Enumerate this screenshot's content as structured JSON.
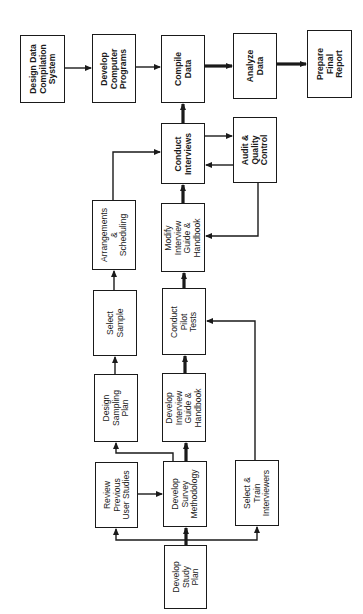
{
  "diagram": {
    "type": "flowchart",
    "orientation": "rotated-90-ccw",
    "nodes": [
      {
        "id": "design_data_compilation",
        "label": "Design Data\nCompilation\nSystem",
        "bold": true
      },
      {
        "id": "develop_computer_programs",
        "label": "Develop\nComputer\nPrograms",
        "bold": true
      },
      {
        "id": "compile_data",
        "label": "Compile\nData",
        "bold": true
      },
      {
        "id": "analyze_data",
        "label": "Analyze\nData",
        "bold": true
      },
      {
        "id": "prepare_final_report",
        "label": "Prepare\nFinal\nReport",
        "bold": true
      },
      {
        "id": "conduct_interviews",
        "label": "Conduct\nInterviews",
        "bold": true
      },
      {
        "id": "audit_quality_control",
        "label": "Audit &\nQuality\nControl",
        "bold": true
      },
      {
        "id": "arrangements_scheduling",
        "label": "Arrangements\n&\nScheduling",
        "bold": false
      },
      {
        "id": "modify_interview_guide",
        "label": "Modify\nInterview\nGuide &\nHandbook",
        "bold": false
      },
      {
        "id": "select_sample",
        "label": "Select\nSample",
        "bold": false
      },
      {
        "id": "conduct_pilot_tests",
        "label": "Conduct\nPilot\nTests",
        "bold": false
      },
      {
        "id": "design_sampling_plan",
        "label": "Design\nSampling\nPlan",
        "bold": false
      },
      {
        "id": "develop_interview_guide",
        "label": "Develop\nInterview\nGuide &\nHandbook",
        "bold": false
      },
      {
        "id": "review_previous_studies",
        "label": "Review\nPrevious\nUser Studies",
        "bold": false
      },
      {
        "id": "develop_survey_methodology",
        "label": "Develop\nSurvey\nMethodology",
        "bold": false
      },
      {
        "id": "select_train_interviewers",
        "label": "Select &\nTrain\nInterviewers",
        "bold": false
      },
      {
        "id": "develop_study_plan",
        "label": "Develop\nStudy\nPlan",
        "bold": false
      }
    ],
    "edges": [
      {
        "from": "design_data_compilation",
        "to": "develop_computer_programs",
        "weight": "normal"
      },
      {
        "from": "develop_computer_programs",
        "to": "compile_data",
        "weight": "normal"
      },
      {
        "from": "compile_data",
        "to": "analyze_data",
        "weight": "heavy"
      },
      {
        "from": "analyze_data",
        "to": "prepare_final_report",
        "weight": "heavy"
      },
      {
        "from": "conduct_interviews",
        "to": "compile_data",
        "weight": "heavy"
      },
      {
        "from": "conduct_interviews",
        "to": "audit_quality_control",
        "weight": "normal"
      },
      {
        "from": "audit_quality_control",
        "to": "conduct_interviews",
        "weight": "normal"
      },
      {
        "from": "audit_quality_control",
        "to": "modify_interview_guide",
        "weight": "normal"
      },
      {
        "from": "arrangements_scheduling",
        "to": "conduct_interviews",
        "weight": "normal"
      },
      {
        "from": "modify_interview_guide",
        "to": "conduct_interviews",
        "weight": "heavy"
      },
      {
        "from": "select_sample",
        "to": "arrangements_scheduling",
        "weight": "normal"
      },
      {
        "from": "conduct_pilot_tests",
        "to": "modify_interview_guide",
        "weight": "heavy"
      },
      {
        "from": "design_sampling_plan",
        "to": "select_sample",
        "weight": "normal"
      },
      {
        "from": "develop_interview_guide",
        "to": "conduct_pilot_tests",
        "weight": "heavy"
      },
      {
        "from": "select_train_interviewers",
        "to": "conduct_pilot_tests",
        "weight": "normal"
      },
      {
        "from": "develop_survey_methodology",
        "to": "design_sampling_plan",
        "weight": "normal"
      },
      {
        "from": "develop_survey_methodology",
        "to": "develop_interview_guide",
        "weight": "heavy"
      },
      {
        "from": "review_previous_studies",
        "to": "develop_survey_methodology",
        "weight": "normal"
      },
      {
        "from": "develop_study_plan",
        "to": "develop_survey_methodology",
        "weight": "heavy"
      },
      {
        "from": "develop_study_plan",
        "to": "review_previous_studies",
        "weight": "normal"
      },
      {
        "from": "develop_study_plan",
        "to": "select_train_interviewers",
        "weight": "normal"
      }
    ]
  },
  "colors": {
    "line": "#1a1a1a",
    "background": "#ffffff"
  }
}
